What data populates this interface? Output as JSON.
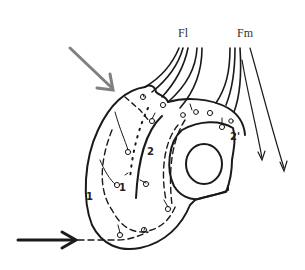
{
  "diagram": {
    "labels": {
      "fl": "Fl",
      "fm": "Fm",
      "region_1_outer": "1",
      "region_1_inner": "1",
      "region_2": "2",
      "region_2_prime": "2'"
    },
    "colors": {
      "line": "#1a1a1a",
      "gray_arrow": "#808080",
      "black_arrow": "#1a1a1a",
      "background": "#ffffff"
    },
    "arrows": [
      {
        "name": "gray-arrow",
        "color": "gray",
        "direction": "down-right"
      },
      {
        "name": "black-arrow",
        "color": "black",
        "direction": "right"
      }
    ]
  }
}
